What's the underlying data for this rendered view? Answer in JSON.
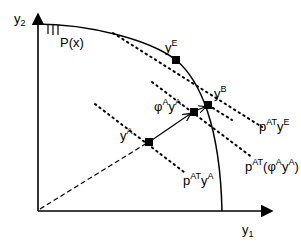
{
  "diagram": {
    "axes": {
      "y_axis_label": "y",
      "y_axis_sub": "2",
      "x_axis_label": "y",
      "x_axis_sub": "1"
    },
    "frontier_label": "P(x)",
    "points": {
      "yE": {
        "base": "y",
        "sup": "E"
      },
      "yB": {
        "base": "y",
        "sup": "B"
      },
      "yA": {
        "base": "y",
        "sup": "A"
      },
      "phiA_yA": {
        "phi": "φ",
        "phi_sup": "A",
        "base": "y",
        "sup": "A"
      }
    },
    "price_lines": {
      "pE": {
        "p": "p",
        "sup": "AT",
        "base": "y",
        "base_sup": "E"
      },
      "pPhi": {
        "p": "p",
        "sup": "AT",
        "open": "(",
        "phi": "φ",
        "phi_sup": "A",
        "base": "y",
        "base_sup": "A",
        "close": ")"
      },
      "pA": {
        "p": "p",
        "sup": "AT",
        "base": "y",
        "base_sup": "A"
      }
    },
    "colors": {
      "ink": "#000000",
      "background": "#ffffff"
    }
  }
}
